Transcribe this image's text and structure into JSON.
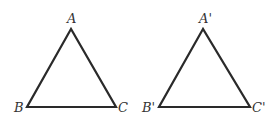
{
  "diagram": {
    "stroke_color": "#2a2a2a",
    "label_color": "#333333",
    "triangles": [
      {
        "name": "ABC",
        "vertices": {
          "A": {
            "label": "A",
            "x": 71,
            "y": 29,
            "label_x": 67,
            "label_y": 23
          },
          "B": {
            "label": "B",
            "x": 27,
            "y": 107,
            "label_x": 14,
            "label_y": 112
          },
          "C": {
            "label": "C",
            "x": 116,
            "y": 107,
            "label_x": 118,
            "label_y": 112
          }
        }
      },
      {
        "name": "A'B'C'",
        "vertices": {
          "A": {
            "label": "A'",
            "x": 203,
            "y": 29,
            "label_x": 199,
            "label_y": 23
          },
          "B": {
            "label": "B'",
            "x": 159,
            "y": 107,
            "label_x": 142,
            "label_y": 112
          },
          "C": {
            "label": "C'",
            "x": 250,
            "y": 107,
            "label_x": 252,
            "label_y": 112
          }
        }
      }
    ]
  }
}
